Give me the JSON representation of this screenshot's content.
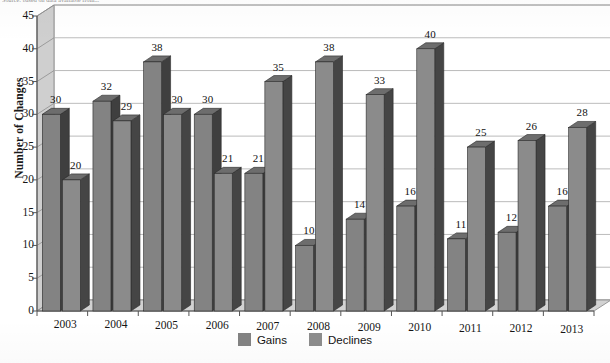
{
  "source_note": "Source: based on data available from...",
  "chart_data": {
    "type": "bar",
    "title": "",
    "subtitle": "",
    "xlabel": "",
    "ylabel": "Number of Changes",
    "ylim": [
      0,
      45
    ],
    "ytick_step": 5,
    "yticks": [
      "0",
      "5",
      "10",
      "15",
      "20",
      "25",
      "30",
      "35",
      "40",
      "45"
    ],
    "grid": true,
    "grid_axis": "y",
    "three_d": true,
    "legend_position": "bottom-center",
    "categories": [
      "2003",
      "2004",
      "2005",
      "2006",
      "2007",
      "2008",
      "2009",
      "2010",
      "2011",
      "2012",
      "2013"
    ],
    "series": [
      {
        "name": "Gains",
        "color": "#838383",
        "side_color": "#3f3f3f",
        "values": [
          30,
          32,
          38,
          30,
          21,
          10,
          14,
          16,
          11,
          12,
          16
        ]
      },
      {
        "name": "Declines",
        "color": "#8b8b8b",
        "side_color": "#454545",
        "values": [
          20,
          29,
          30,
          21,
          35,
          38,
          33,
          40,
          25,
          26,
          28
        ]
      }
    ]
  },
  "legend": {
    "items": [
      {
        "label": "Gains",
        "color": "#838383"
      },
      {
        "label": "Declines",
        "color": "#8d8d8d"
      }
    ]
  },
  "colors": {
    "plot_background": "#ffffff",
    "wall": "#cfcfcf",
    "floor": "#d2d2d2",
    "gridline": "#a9a9a9",
    "axis": "#555555",
    "text": "#151515"
  }
}
